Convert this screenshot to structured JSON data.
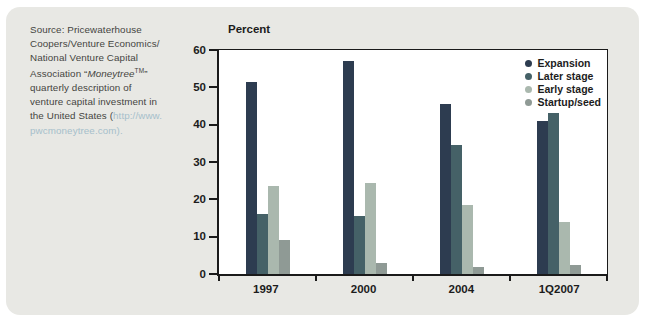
{
  "colors": {
    "panel_background": "#e8e8e4",
    "axis": "#1a1a1a",
    "link": "#a6bfcb",
    "source_text": "#45453f"
  },
  "source_note": {
    "lines": [
      [
        {
          "t": "Source: Pricewaterhouse",
          "s": ""
        }
      ],
      [
        {
          "t": "Coopers/Venture Economics/",
          "s": ""
        }
      ],
      [
        {
          "t": "National Venture Capital",
          "s": ""
        }
      ],
      [
        {
          "t": "Association “",
          "s": ""
        },
        {
          "t": "Moneytree",
          "s": "i"
        },
        {
          "t": "TM",
          "s": "sup"
        },
        {
          "t": "”",
          "s": ""
        }
      ],
      [
        {
          "t": "quarterly description of",
          "s": ""
        }
      ],
      [
        {
          "t": "venture capital investment in",
          "s": ""
        }
      ],
      [
        {
          "t": "the United States (",
          "s": ""
        },
        {
          "t": "http://www.",
          "s": "link"
        }
      ],
      [
        {
          "t": "pwcmoneytree.com",
          "s": "link"
        },
        {
          "t": ").",
          "s": "link"
        }
      ]
    ]
  },
  "chart_data": {
    "type": "bar",
    "title": "",
    "xlabel": "",
    "ylabel": "Percent",
    "categories": [
      "1997",
      "2000",
      "2004",
      "1Q2007"
    ],
    "series": [
      {
        "name": "Expansion",
        "color": "#2d3c50",
        "values": [
          51.5,
          57,
          45.5,
          41
        ]
      },
      {
        "name": "Later stage",
        "color": "#456167",
        "values": [
          16,
          15.5,
          34.5,
          43
        ]
      },
      {
        "name": "Early stage",
        "color": "#aab8ae",
        "values": [
          23.5,
          24.5,
          18.5,
          14
        ]
      },
      {
        "name": "Startup/seed",
        "color": "#8f9a95",
        "values": [
          9,
          3,
          2,
          2.5
        ]
      }
    ],
    "ylim": [
      0,
      60
    ],
    "yticks": [
      0,
      10,
      20,
      30,
      40,
      50,
      60
    ],
    "grid": false,
    "legend_position": "top-right"
  }
}
